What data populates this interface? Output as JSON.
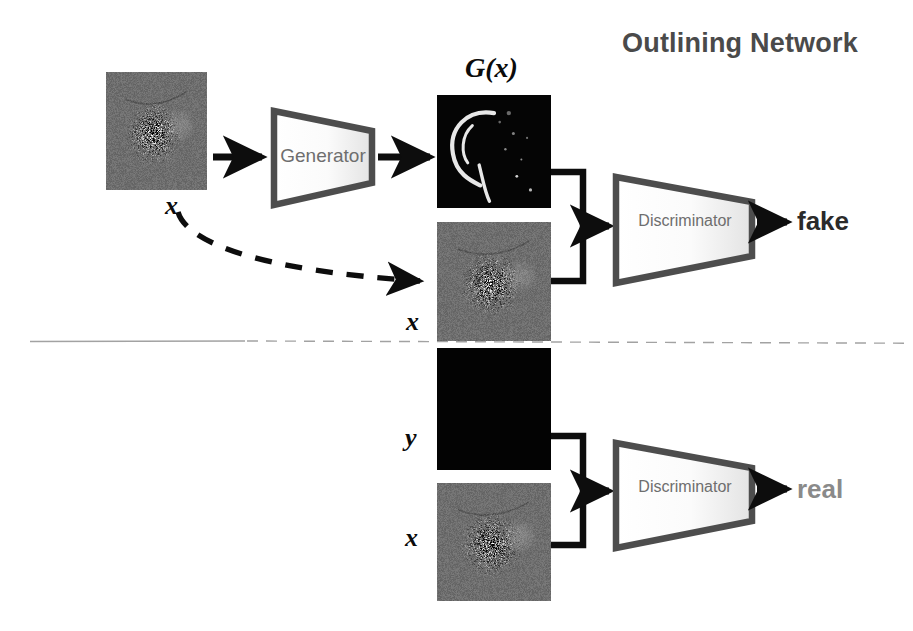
{
  "canvas": {
    "width": 913,
    "height": 631,
    "background": "#ffffff"
  },
  "header": {
    "title": "Outlining Network",
    "title_color": "#4a4a4a"
  },
  "colors": {
    "shape_stroke": "#4d4d4d",
    "shape_fill_light": "#fdfdfd",
    "shape_fill_dark": "#e6e6e6",
    "arrow": "#0d0d0d",
    "divider": "#9a9a9a",
    "fake_text": "#2a2a2a",
    "real_text": "#8a8a8a",
    "label_text": "#6e6e6e",
    "math_text": "#0b0b0b"
  },
  "branches": {
    "fake": {
      "name": "fake-branch",
      "nodes": {
        "generator": {
          "label": "Generator",
          "font_size": 19
        },
        "discriminator": {
          "label": "Discriminator",
          "font_size": 16
        }
      },
      "verdict": {
        "label": "fake",
        "color": "#2a2a2a"
      },
      "images": [
        {
          "id": "input-x-top",
          "caption": "x",
          "kind": "magnetogram",
          "x": 106,
          "y": 72,
          "w": 101,
          "h": 118
        },
        {
          "id": "generated-gx",
          "caption": "G(x)",
          "kind": "outline-mask",
          "x": 437,
          "y": 95,
          "w": 114,
          "h": 113
        },
        {
          "id": "paired-x-top",
          "caption": "x",
          "kind": "magnetogram",
          "x": 437,
          "y": 222,
          "w": 114,
          "h": 119
        }
      ]
    },
    "real": {
      "name": "real-branch",
      "nodes": {
        "discriminator": {
          "label": "Discriminator",
          "font_size": 16
        }
      },
      "verdict": {
        "label": "real",
        "color": "#8a8a8a"
      },
      "images": [
        {
          "id": "ground-truth-y",
          "caption": "y",
          "kind": "black-mask",
          "x": 437,
          "y": 348,
          "w": 114,
          "h": 122
        },
        {
          "id": "paired-x-bottom",
          "caption": "x",
          "kind": "magnetogram",
          "x": 437,
          "y": 483,
          "w": 114,
          "h": 118
        }
      ]
    }
  },
  "captions": {
    "gx_top": "G(x)",
    "x_under_input": "x",
    "x_middle": "x",
    "y_bottom": "y",
    "x_bottom": "x"
  },
  "divider": {
    "name": "branch-divider",
    "y": 341,
    "style": "solid-to-dashed"
  },
  "connectors": {
    "skip_connection": {
      "style": "dashed-curve",
      "from": "input-x-top",
      "to": "paired-x-top"
    },
    "bracket_top": {
      "style": "square-bracket"
    },
    "bracket_bottom": {
      "style": "square-bracket"
    }
  }
}
